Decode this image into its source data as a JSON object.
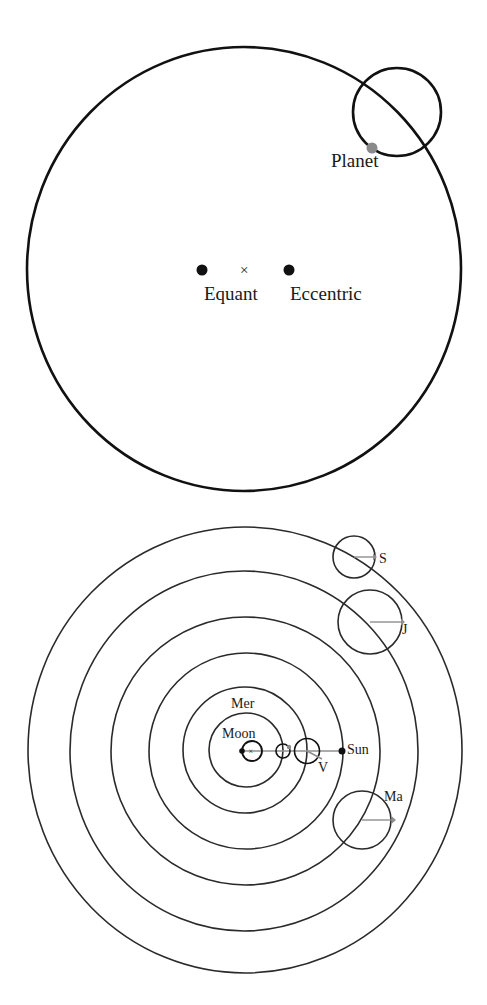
{
  "colors": {
    "stroke": "#111111",
    "orbit_stroke": "#2a2a2a",
    "planet_dot": "#8a8a8a",
    "pointer_line": "#8f8f8f",
    "background": "#ffffff"
  },
  "top_diagram": {
    "title": "Equant and eccentric model",
    "deferent": {
      "cx": 244,
      "cy": 269,
      "rx": 217,
      "ry": 222
    },
    "epicycle": {
      "cx": 397,
      "cy": 112,
      "r": 44
    },
    "planet": {
      "cx": 372,
      "cy": 148,
      "r": 5,
      "label": "Planet"
    },
    "equant": {
      "cx": 202,
      "cy": 270,
      "label": "Equant"
    },
    "center_mark": {
      "x": 245,
      "y": 269,
      "symbol": "×"
    },
    "eccentric": {
      "cx": 289,
      "cy": 270,
      "label": "Eccentric"
    }
  },
  "bottom_diagram": {
    "title": "Geocentric nested orbits",
    "center": {
      "cx": 245,
      "cy": 751
    },
    "earth_dot": {
      "cx": 242,
      "cy": 751
    },
    "center_mark": {
      "symbol": "×"
    },
    "rings_r": [
      37,
      62,
      97,
      134,
      177,
      220
    ],
    "bodies": [
      {
        "name": "Moon",
        "label": "Moon"
      },
      {
        "name": "Mercury",
        "label": "Mer"
      },
      {
        "name": "Venus",
        "label": "V"
      },
      {
        "name": "Sun",
        "label": "Sun"
      },
      {
        "name": "Mars",
        "label": "Ma"
      },
      {
        "name": "Jupiter",
        "label": "J"
      },
      {
        "name": "Saturn",
        "label": "S"
      }
    ]
  }
}
